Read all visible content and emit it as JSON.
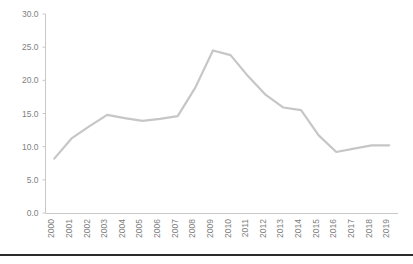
{
  "chart_data": {
    "type": "line",
    "title": "",
    "subtitle": "",
    "xlabel": "",
    "ylabel": "",
    "grid": false,
    "legend": false,
    "legend_position": "none",
    "line_color": "#c6c6c6",
    "axis_color": "#c8c8c8",
    "tick_label_color": "#808080",
    "xtick_rotation": 90,
    "categories": [
      "2000",
      "2001",
      "2002",
      "2003",
      "2004",
      "2005",
      "2006",
      "2007",
      "2008",
      "2009",
      "2010",
      "2011",
      "2012",
      "2013",
      "2014",
      "2015",
      "2016",
      "2017",
      "2018",
      "2019"
    ],
    "values": [
      8.2,
      11.3,
      13.1,
      14.8,
      14.3,
      13.9,
      14.2,
      14.6,
      18.9,
      24.5,
      23.8,
      20.6,
      17.8,
      15.9,
      15.5,
      11.7,
      9.2,
      9.7,
      10.2,
      10.2
    ],
    "ylim": [
      0.0,
      30.0
    ],
    "ytick_step": 5.0,
    "yticks": [
      "0.0",
      "5.0",
      "10.0",
      "15.0",
      "20.0",
      "25.0",
      "30.0"
    ],
    "ytick_values": [
      0.0,
      5.0,
      10.0,
      15.0,
      20.0,
      25.0,
      30.0
    ]
  },
  "footer": {
    "rule_color": "#2b2b2b"
  }
}
